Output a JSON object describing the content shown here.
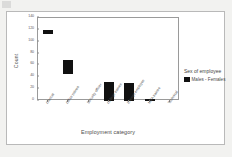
{
  "chart_data": {
    "type": "bar",
    "title": "",
    "xlabel": "Employment category",
    "ylabel": "Count",
    "ylim": [
      0,
      140
    ],
    "yticks": [
      0,
      20,
      40,
      60,
      80,
      100,
      120,
      140
    ],
    "ytick_labels": [
      "0",
      "20",
      "40",
      "60",
      "80",
      "100",
      "120",
      "140"
    ],
    "grid": false,
    "legend_position": "right",
    "legend_title": "Sex of employee",
    "series": [
      {
        "name": "Males - Females",
        "color": "#111111",
        "values": [
          120,
          70,
          0,
          32,
          31,
          3,
          0
        ],
        "base_values": [
          113,
          45,
          0,
          0,
          0,
          0,
          0
        ]
      }
    ],
    "categories": [
      "Clerical",
      "Office trainee",
      "Security officer",
      "College trainee",
      "Exempt employee",
      "MBA trainee",
      "Technical"
    ],
    "bars": [
      {
        "category": "Clerical",
        "top": 120,
        "bottom": 113,
        "visible": true
      },
      {
        "category": "Office trainee",
        "top": 70,
        "bottom": 45,
        "visible": true
      },
      {
        "category": "Security officer",
        "top": 0,
        "bottom": 0,
        "visible": false
      },
      {
        "category": "College trainee",
        "top": 32,
        "bottom": 0,
        "visible": true
      },
      {
        "category": "Exempt employee",
        "top": 31,
        "bottom": 0,
        "visible": true
      },
      {
        "category": "MBA trainee",
        "top": 3,
        "bottom": 0,
        "visible": true
      },
      {
        "category": "Technical",
        "top": 0,
        "bottom": 0,
        "visible": false
      }
    ]
  },
  "legend": {
    "title": "Sex of employee",
    "entries": [
      {
        "label": "Males - Females",
        "color": "#111111"
      }
    ]
  },
  "axes": {
    "y_title": "Count",
    "x_title": "Employment category"
  }
}
